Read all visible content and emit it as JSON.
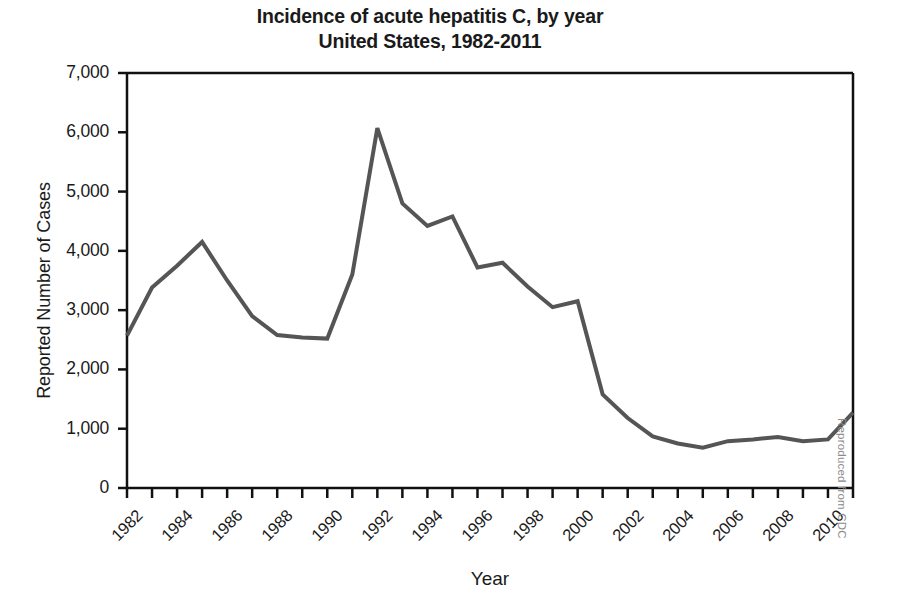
{
  "figure": {
    "title_line1": "Incidence of acute hepatitis C, by year",
    "title_line2": "United States, 1982-2011",
    "credit": "Reproduced from CDC"
  },
  "chart_data": {
    "type": "line",
    "title": "Incidence of acute hepatitis C, by year United States, 1982-2011",
    "xlabel": "Year",
    "ylabel": "Reported Number of Cases",
    "xlim": [
      1982,
      2011
    ],
    "ylim": [
      0,
      7000
    ],
    "grid": false,
    "legend": null,
    "y_ticks": [
      0,
      1000,
      2000,
      3000,
      4000,
      5000,
      6000,
      7000
    ],
    "y_tick_labels": [
      "0",
      "1,000",
      "2,000",
      "3,000",
      "4,000",
      "5,000",
      "6,000",
      "7,000"
    ],
    "x_ticks": [
      1982,
      1983,
      1984,
      1985,
      1986,
      1987,
      1988,
      1989,
      1990,
      1991,
      1992,
      1993,
      1994,
      1995,
      1996,
      1997,
      1998,
      1999,
      2000,
      2001,
      2002,
      2003,
      2004,
      2005,
      2006,
      2007,
      2008,
      2009,
      2010,
      2011
    ],
    "x_tick_labels": [
      "1982",
      "1984",
      "1986",
      "1988",
      "1990",
      "1992",
      "1994",
      "1996",
      "1998",
      "2000",
      "2002",
      "2004",
      "2006",
      "2008",
      "2010"
    ],
    "x_tick_label_years": [
      1982,
      1984,
      1986,
      1988,
      1990,
      1992,
      1994,
      1996,
      1998,
      2000,
      2002,
      2004,
      2006,
      2008,
      2010
    ],
    "line_color": "#555555",
    "line_width": 4,
    "x": [
      1982,
      1983,
      1984,
      1985,
      1986,
      1987,
      1988,
      1989,
      1990,
      1991,
      1992,
      1993,
      1994,
      1995,
      1996,
      1997,
      1998,
      1999,
      2000,
      2001,
      2002,
      2003,
      2004,
      2005,
      2006,
      2007,
      2008,
      2009,
      2010,
      2011
    ],
    "values": [
      2570,
      3380,
      3750,
      4150,
      3500,
      2900,
      2580,
      2540,
      2520,
      3600,
      6070,
      4800,
      4420,
      4580,
      3720,
      3800,
      3400,
      3050,
      3150,
      1580,
      1180,
      870,
      750,
      680,
      790,
      820,
      860,
      790,
      820,
      1270
    ]
  }
}
